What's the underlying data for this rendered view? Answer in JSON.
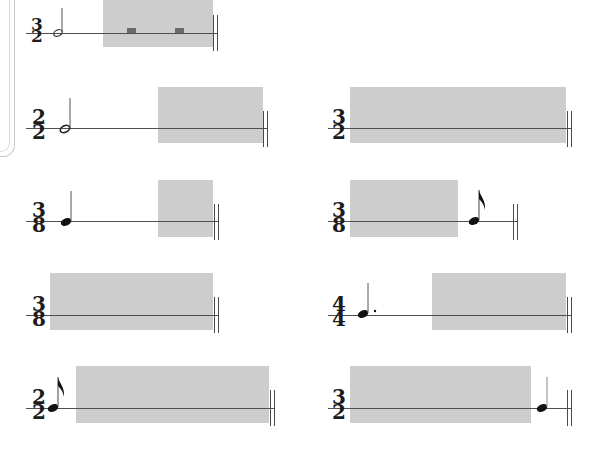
{
  "colors": {
    "background": "#ffffff",
    "highlight_box": "#cdcdcd",
    "staff_line": "#505050",
    "note": "#1c1c1c"
  },
  "rows": [
    {
      "left": {
        "time_signature": {
          "top": "3",
          "bottom": "2"
        },
        "notes": [
          {
            "type": "half",
            "dotted": false
          }
        ],
        "rests": [
          "whole-rest",
          "half-rest"
        ],
        "highlight": true,
        "end_barline": "double"
      }
    },
    {
      "left": {
        "time_signature": {
          "top": "2",
          "bottom": "2"
        },
        "notes": [
          {
            "type": "half",
            "dotted": false
          }
        ],
        "highlight": true,
        "end_barline": "double"
      },
      "right": {
        "time_signature": {
          "top": "3",
          "bottom": "2"
        },
        "notes": [],
        "highlight": true,
        "end_barline": "double"
      }
    },
    {
      "left": {
        "time_signature": {
          "top": "3",
          "bottom": "8"
        },
        "notes": [
          {
            "type": "quarter",
            "dotted": false
          }
        ],
        "highlight": true,
        "end_barline": "double"
      },
      "right": {
        "time_signature": {
          "top": "3",
          "bottom": "8"
        },
        "notes": [
          {
            "type": "eighth",
            "dotted": false
          }
        ],
        "highlight": true,
        "end_barline": "double"
      }
    },
    {
      "left": {
        "time_signature": {
          "top": "3",
          "bottom": "8"
        },
        "notes": [],
        "highlight": true,
        "end_barline": "double"
      },
      "right": {
        "time_signature": {
          "top": "4",
          "bottom": "4"
        },
        "notes": [
          {
            "type": "quarter",
            "dotted": true
          }
        ],
        "highlight": true,
        "end_barline": "double"
      }
    },
    {
      "left": {
        "time_signature": {
          "top": "2",
          "bottom": "2"
        },
        "notes": [
          {
            "type": "eighth",
            "dotted": false
          }
        ],
        "highlight": true,
        "end_barline": "double"
      },
      "right": {
        "time_signature": {
          "top": "3",
          "bottom": "2"
        },
        "notes": [
          {
            "type": "quarter",
            "dotted": false
          }
        ],
        "highlight": true,
        "end_barline": "double"
      }
    }
  ]
}
